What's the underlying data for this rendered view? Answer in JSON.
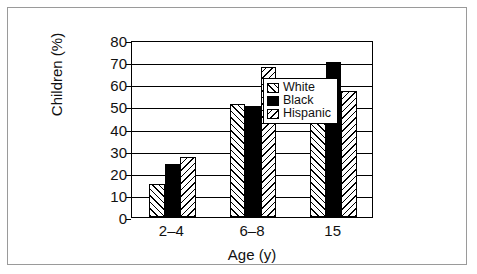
{
  "chart_data": {
    "type": "bar",
    "title": "",
    "xlabel": "Age (y)",
    "ylabel": "Children (%)",
    "ylim": [
      0,
      80
    ],
    "yticks": [
      0,
      10,
      20,
      30,
      40,
      50,
      60,
      70,
      80
    ],
    "grid": true,
    "legend_position": "top-left-inside",
    "categories": [
      "2–4",
      "6–8",
      "15"
    ],
    "series": [
      {
        "name": "White",
        "pattern": "forward-diagonal-hatch",
        "color": "#ffffff",
        "values": [
          15,
          51,
          60
        ]
      },
      {
        "name": "Black",
        "pattern": "solid-black",
        "color": "#000000",
        "values": [
          24,
          50,
          70
        ]
      },
      {
        "name": "Hispanic",
        "pattern": "backward-diagonal-hatch",
        "color": "#ffffff",
        "values": [
          27,
          68,
          57
        ]
      }
    ]
  },
  "legend": {
    "items": [
      {
        "label": "White"
      },
      {
        "label": "Black"
      },
      {
        "label": "Hispanic"
      }
    ]
  },
  "axes": {
    "y_title": "Children (%)",
    "x_title": "Age (y)",
    "y_tick_labels": [
      "80",
      "70",
      "60",
      "50",
      "40",
      "30",
      "20",
      "10",
      "0"
    ],
    "x_tick_labels": [
      "2–4",
      "6–8",
      "15"
    ]
  },
  "colors": {
    "frame": "#9a9a9a",
    "axis": "#000000",
    "text": "#111111",
    "background": "#ffffff"
  }
}
